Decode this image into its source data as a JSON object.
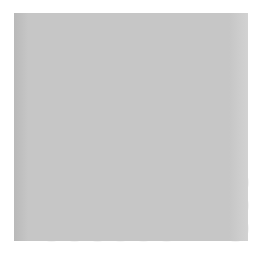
{
  "figure": {
    "type": "go-board-diagram",
    "title": "",
    "board": {
      "background_color": "#c3c3c3",
      "line_color": "#4a4a4a",
      "columns": 10,
      "rows": 10,
      "column_x": [
        28,
        51,
        74,
        97,
        120,
        143,
        166,
        189,
        212,
        235
      ],
      "row_y": [
        23,
        45,
        68,
        90,
        113,
        136,
        159,
        181,
        204,
        227
      ],
      "star_points": [
        {
          "col": 4,
          "row": 1
        },
        {
          "col": 10,
          "row": 1
        },
        {
          "col": 10,
          "row": 7
        }
      ]
    },
    "stones": [
      {
        "col": 6,
        "row": 5,
        "color": "black",
        "label": ""
      },
      {
        "col": 7,
        "row": 5,
        "color": "black",
        "label": ""
      },
      {
        "col": 8,
        "row": 5,
        "color": "black",
        "label": ""
      },
      {
        "col": 4,
        "row": 6,
        "color": "black",
        "label": ""
      },
      {
        "col": 5,
        "row": 6,
        "color": "black",
        "label": ""
      },
      {
        "col": 8,
        "row": 6,
        "color": "black",
        "label": ""
      },
      {
        "col": 9,
        "row": 6,
        "color": "black",
        "label": ""
      },
      {
        "col": 2,
        "row": 7,
        "color": "black",
        "label": ""
      },
      {
        "col": 4,
        "row": 7,
        "color": "white",
        "label": ""
      },
      {
        "col": 5,
        "row": 7,
        "color": "white",
        "label": ""
      },
      {
        "col": 6,
        "row": 7,
        "color": "white",
        "label": ""
      },
      {
        "col": 7,
        "row": 7,
        "color": "white",
        "label": ""
      },
      {
        "col": 9,
        "row": 7,
        "color": "black",
        "label": ""
      },
      {
        "col": 2,
        "row": 8,
        "color": "black",
        "label": ""
      },
      {
        "col": 4,
        "row": 8,
        "color": "white",
        "label": ""
      },
      {
        "col": 6,
        "row": 8,
        "color": "black",
        "label": "가"
      },
      {
        "col": 7,
        "row": 8,
        "color": "white",
        "label": ""
      },
      {
        "col": 8,
        "row": 8,
        "color": "white",
        "label": ""
      },
      {
        "col": 9,
        "row": 8,
        "color": "black",
        "label": ""
      },
      {
        "col": 10,
        "row": 8,
        "color": "black",
        "label": ""
      },
      {
        "col": 2,
        "row": 9,
        "color": "black",
        "label": ""
      },
      {
        "col": 4,
        "row": 9,
        "color": "white",
        "label": ""
      },
      {
        "col": 5,
        "row": 9,
        "color": "white",
        "label": ""
      },
      {
        "col": 6,
        "row": 9,
        "color": "white",
        "label": "1"
      },
      {
        "col": 8,
        "row": 9,
        "color": "white",
        "label": ""
      },
      {
        "col": 10,
        "row": 9,
        "color": "black",
        "label": ""
      },
      {
        "col": 2,
        "row": 10,
        "color": "black",
        "label": ""
      },
      {
        "col": 3,
        "row": 10,
        "color": "black",
        "label": ""
      },
      {
        "col": 4,
        "row": 10,
        "color": "black",
        "label": ""
      },
      {
        "col": 5,
        "row": 10,
        "color": "white",
        "label": ""
      },
      {
        "col": 6,
        "row": 10,
        "color": "white",
        "label": ""
      },
      {
        "col": 7,
        "row": 10,
        "color": "white",
        "label": ""
      },
      {
        "col": 10,
        "row": 10,
        "color": "black",
        "label": ""
      }
    ],
    "markers": [
      {
        "text": "가",
        "on": "black-stone",
        "text_color": "#ffffff"
      },
      {
        "text": "1",
        "on": "white-stone",
        "text_color": "#111111"
      }
    ]
  }
}
